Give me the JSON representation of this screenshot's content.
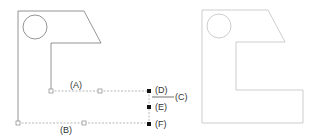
{
  "diagram": {
    "left_figure": {
      "description": "Profile with circle and dimension constraints",
      "stroke": "#7a7a7a",
      "labels": {
        "A": "(A)",
        "B": "(B)",
        "C": "(C)",
        "D": "(D)",
        "E": "(E)",
        "F": "(F)"
      }
    },
    "right_figure": {
      "description": "Closed profile with circle",
      "stroke": "#c0c0c0"
    },
    "colors": {
      "dimension_line": "#9a9a9a",
      "handle_fill": "#111111",
      "open_handle": "#888888"
    }
  }
}
